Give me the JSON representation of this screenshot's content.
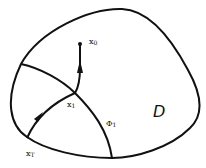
{
  "diagram": {
    "region_label": "D",
    "labels": {
      "x0": {
        "base": "x",
        "sub": "0"
      },
      "x1": {
        "base": "x",
        "sub": "1"
      },
      "xT": {
        "base": "x",
        "sub": "T"
      },
      "phi1": {
        "base": "Φ",
        "sub": "1"
      }
    },
    "colors": {
      "stroke": "#111111",
      "background": "#ffffff"
    }
  }
}
